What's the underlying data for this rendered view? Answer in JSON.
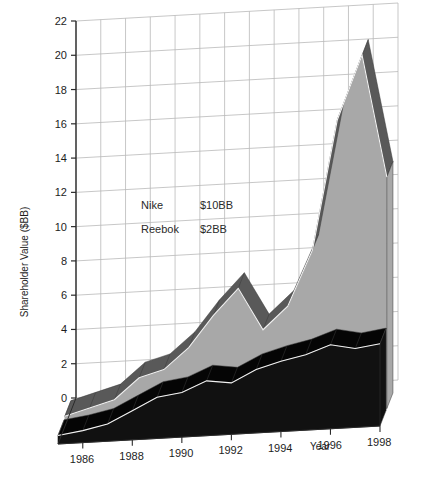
{
  "chart_data": {
    "type": "area",
    "title": "",
    "subtitle": "",
    "xlabel": "Year",
    "ylabel": "Shareholder Value ($BB)",
    "x": [
      1985,
      1986,
      1987,
      1988,
      1989,
      1990,
      1991,
      1992,
      1993,
      1994,
      1995,
      1996,
      1997,
      1998
    ],
    "xtick_labels": [
      "1986",
      "1988",
      "1990",
      "1992",
      "1994",
      "1996",
      "1998"
    ],
    "xticks": [
      1986,
      1988,
      1990,
      1992,
      1994,
      1996,
      1998
    ],
    "ytick_labels": [
      "0",
      "2",
      "4",
      "6",
      "8",
      "10",
      "12",
      "14",
      "16",
      "18",
      "20",
      "22"
    ],
    "yticks": [
      0,
      2,
      4,
      6,
      8,
      10,
      12,
      14,
      16,
      18,
      20,
      22
    ],
    "ylim": [
      0,
      22
    ],
    "grid": true,
    "legend_position": "inside-upper-left",
    "projection": "3d-area-ribbon",
    "series": [
      {
        "name": "Nike",
        "value_label": "$10BB",
        "color": "#a8a8a8",
        "top_color": "#595959",
        "values": [
          0.6,
          1.0,
          1.4,
          2.6,
          3.0,
          4.2,
          6.0,
          7.5,
          5.0,
          6.3,
          9.5,
          17.0,
          20.7,
          13.5
        ]
      },
      {
        "name": "Reebok",
        "value_label": "$2BB",
        "color": "#111111",
        "top_color": "#050505",
        "values": [
          0.5,
          0.7,
          1.0,
          1.7,
          2.4,
          2.6,
          3.2,
          3.0,
          3.7,
          4.1,
          4.4,
          4.9,
          4.6,
          4.8
        ]
      }
    ]
  },
  "legend": {
    "rows": [
      {
        "name": "Nike",
        "value": "$10BB"
      },
      {
        "name": "Reebok",
        "value": "$2BB"
      }
    ]
  },
  "axes": {
    "y_title": "Shareholder Value ($BB)",
    "x_title": "Year"
  }
}
